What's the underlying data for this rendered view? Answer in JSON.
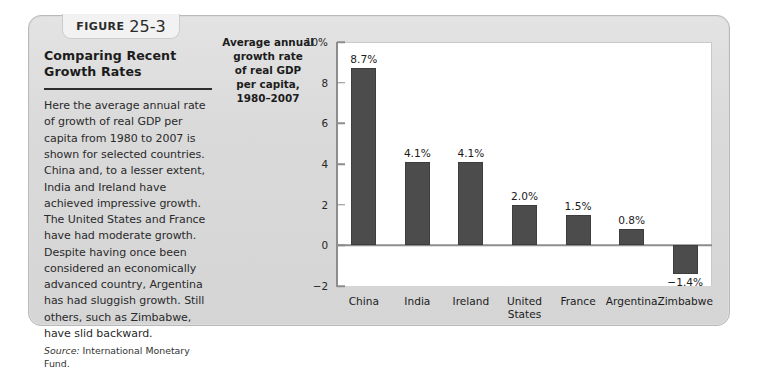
{
  "figure": {
    "tab_word": "Figure",
    "tab_number": "25-3",
    "caption_title": "Comparing Recent Growth Rates",
    "caption_body": "Here the average annual rate of growth of real GDP per capita from 1980 to 2007 is shown for selected countries. China and, to a lesser extent, India and Ireland have achieved impressive growth. The United States and France have had moderate growth. Despite having once been considered an economically advanced country, Argentina has had sluggish growth. Still others, such as Zimbabwe, have slid backward.",
    "source_label": "Source:",
    "source_text": "International Monetary Fund."
  },
  "chart_data": {
    "type": "bar",
    "title": "",
    "xlabel": "",
    "ylabel": "Average annual growth rate of real GDP per capita, 1980–2007",
    "ylabel_lines": [
      "Average annual",
      "growth rate",
      "of real GDP",
      "per capita,",
      "1980–2007"
    ],
    "categories": [
      "China",
      "India",
      "Ireland",
      "United States",
      "France",
      "Argentina",
      "Zimbabwe"
    ],
    "category_lines": [
      [
        "China"
      ],
      [
        "India"
      ],
      [
        "Ireland"
      ],
      [
        "United",
        "States"
      ],
      [
        "France"
      ],
      [
        "Argentina"
      ],
      [
        "Zimbabwe"
      ]
    ],
    "values": [
      8.7,
      4.1,
      4.1,
      2.0,
      1.5,
      0.8,
      -1.4
    ],
    "data_labels": [
      "8.7%",
      "4.1%",
      "4.1%",
      "2.0%",
      "1.5%",
      "0.8%",
      "−1.4%"
    ],
    "ylim": [
      -2,
      10
    ],
    "yticks": [
      10,
      8,
      6,
      4,
      2,
      0,
      -2
    ],
    "ytick_labels": [
      "10%",
      "8",
      "6",
      "4",
      "2",
      "0",
      "−2"
    ],
    "grid": false,
    "legend": null,
    "bar_color": "#4c4c4c",
    "plot_background": "#ffffff",
    "panel_background": "#dcdcdc"
  }
}
